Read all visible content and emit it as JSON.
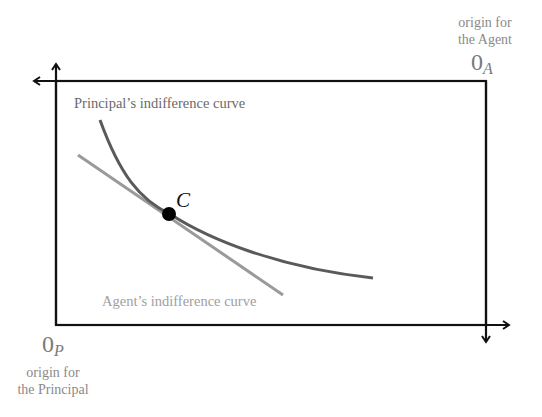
{
  "diagram": {
    "type": "edgeworth-box",
    "agent_origin": {
      "caption_line1": "origin for",
      "caption_line2": "the Agent",
      "symbol": "0",
      "subscript": "A"
    },
    "principal_origin": {
      "caption_line1": "origin for",
      "caption_line2": "the Principal",
      "symbol": "0",
      "subscript": "P"
    },
    "principal_curve": {
      "label": "Principal’s indifference curve",
      "color": "#5a5a5a"
    },
    "agent_curve": {
      "label": "Agent’s indifference curve",
      "color": "#9a9a9a"
    },
    "tangency_point": {
      "label": "C",
      "color": "#000000"
    },
    "box_color": "#111111",
    "label_color": "#8a8a8a"
  }
}
